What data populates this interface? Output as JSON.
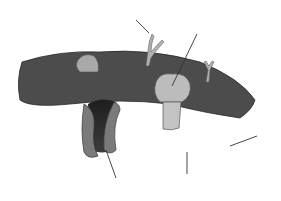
{
  "diagram": {
    "colors": {
      "background": "#ffffff",
      "head": "#6e6e6e",
      "head_outline": "#2a2a2a",
      "top_surface": "#4a4a4a",
      "tail": "#444444",
      "protein_light": "#b9b9b9",
      "channel_outer": "#7a7a7a",
      "channel_inner": "#2e2e2e",
      "label_text": "#222222"
    },
    "labels": [
      {
        "id": "A",
        "text": "A",
        "x": 197,
        "y": 32,
        "target": "peripheral/integral protein (light globular)"
      },
      {
        "id": "B",
        "text": "B",
        "x": 130,
        "y": 23,
        "target": "carbohydrate chain (glycoprotein)"
      },
      {
        "id": "C",
        "text": "C",
        "x": 261,
        "y": 139,
        "target": "fatty acid tail"
      },
      {
        "id": "D",
        "text": "D",
        "x": 114,
        "y": 187,
        "target": "channel protein"
      },
      {
        "id": "E",
        "text": "E",
        "x": 185,
        "y": 183,
        "target": "phosphate head"
      }
    ]
  }
}
